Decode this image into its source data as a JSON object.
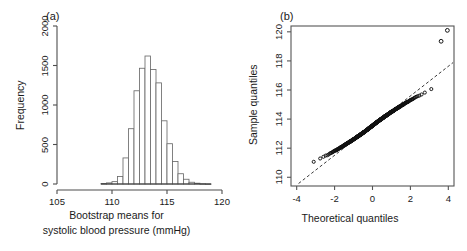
{
  "figure": {
    "panel_a_tag": "(a)",
    "panel_b_tag": "(b)"
  },
  "chart_data": [
    {
      "type": "bar",
      "panel": "(a)",
      "title": "",
      "xlabel_line1": "Bootstrap means for",
      "xlabel_line2": "systolic blood pressure (mmHg)",
      "ylabel": "Frequency",
      "xlim": [
        105,
        120
      ],
      "ylim": [
        0,
        2000
      ],
      "xticks": [
        105,
        110,
        115,
        120
      ],
      "xtick_labels": [
        "105",
        "110",
        "115",
        "120"
      ],
      "yticks": [
        0,
        500,
        1000,
        1500,
        2000
      ],
      "ytick_labels": [
        "0",
        "500",
        "1000",
        "1500",
        "2000"
      ],
      "grid": false,
      "bin_width": 0.5,
      "bin_starts": [
        109.0,
        109.5,
        110.0,
        110.5,
        111.0,
        111.5,
        112.0,
        112.5,
        113.0,
        113.5,
        114.0,
        114.5,
        115.0,
        115.5,
        116.0,
        116.5,
        117.0,
        117.5,
        118.0,
        118.5
      ],
      "categories": [
        "109.0-109.5",
        "109.5-110.0",
        "110.0-110.5",
        "110.5-111.0",
        "111.0-111.5",
        "111.5-112.0",
        "112.0-112.5",
        "112.5-113.0",
        "113.0-113.5",
        "113.5-114.0",
        "114.0-114.5",
        "114.5-115.0",
        "115.0-115.5",
        "115.5-116.0",
        "116.0-116.5",
        "116.5-117.0",
        "117.0-117.5",
        "117.5-118.0",
        "118.0-118.5",
        "118.5-119.0"
      ],
      "values": [
        6,
        14,
        30,
        95,
        330,
        700,
        1180,
        1465,
        1620,
        1450,
        1280,
        800,
        510,
        285,
        130,
        60,
        22,
        10,
        4,
        2
      ]
    },
    {
      "type": "scatter",
      "panel": "(b)",
      "title": "",
      "xlabel": "Theoretical quantiles",
      "ylabel": "Sample quantiles",
      "xlim": [
        -4.3,
        4.3
      ],
      "ylim": [
        109.4,
        120.4
      ],
      "xticks": [
        -4,
        -2,
        0,
        2,
        4
      ],
      "xtick_labels": [
        "-4",
        "-2",
        "0",
        "2",
        "4"
      ],
      "yticks": [
        110,
        112,
        114,
        116,
        118,
        120
      ],
      "ytick_labels": [
        "110",
        "112",
        "114",
        "116",
        "118",
        "120"
      ],
      "grid": false,
      "reference_line": {
        "style": "dashed",
        "slope": 1.02,
        "intercept": 113.55
      },
      "marker": "open-circle",
      "n_points": 520,
      "outliers": [
        {
          "x": 3.95,
          "y": 120.1
        },
        {
          "x": 3.62,
          "y": 119.35
        }
      ],
      "points_note": "dense band of bootstrap sample quantiles along reference line"
    }
  ]
}
